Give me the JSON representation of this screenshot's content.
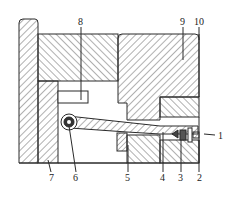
{
  "diagram": {
    "type": "mechanical-cross-section",
    "colors": {
      "line": "#2a2a2a",
      "hatch": "#3a3a3a",
      "background": "#ffffff"
    },
    "labels": [
      {
        "id": "1",
        "text": "1"
      },
      {
        "id": "2",
        "text": "2"
      },
      {
        "id": "3",
        "text": "3"
      },
      {
        "id": "4",
        "text": "4"
      },
      {
        "id": "5",
        "text": "5"
      },
      {
        "id": "6",
        "text": "6"
      },
      {
        "id": "7",
        "text": "7"
      },
      {
        "id": "8",
        "text": "8"
      },
      {
        "id": "9",
        "text": "9"
      },
      {
        "id": "10",
        "text": "10"
      }
    ]
  }
}
